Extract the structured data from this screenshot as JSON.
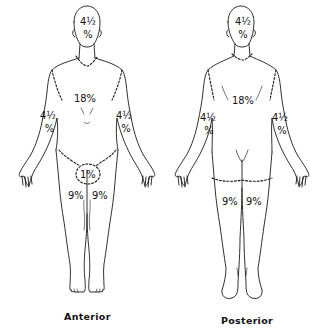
{
  "figure": {
    "stroke_color": "#1a1a1a",
    "background": "#ffffff"
  },
  "anterior": {
    "caption": "Anterior",
    "labels": {
      "head": "4½ %",
      "head_top": "4½",
      "head_bottom": "%",
      "trunk": "18%",
      "left_arm_top": "4½",
      "left_arm_bottom": "%",
      "right_arm_top": "4½",
      "right_arm_bottom": "%",
      "perineum": "1%",
      "left_leg": "9%",
      "right_leg": "9%"
    }
  },
  "posterior": {
    "caption": "Posterior",
    "labels": {
      "head_top": "4½",
      "head_bottom": "%",
      "trunk": "18%",
      "left_arm_top": "4½",
      "left_arm_bottom": "%",
      "right_arm_top": "4½",
      "right_arm_bottom": "%",
      "left_leg": "9%",
      "right_leg": "9%"
    }
  }
}
